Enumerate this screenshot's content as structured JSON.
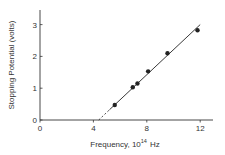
{
  "chart_data": {
    "type": "scatter",
    "title": "",
    "xlabel": "Frequency, 10^14 Hz",
    "xlabel_parts": {
      "main": "Frequency, 10",
      "sup": "14",
      "unit": "Hz"
    },
    "ylabel": "Stopping Potential (volts)",
    "xlim": [
      0,
      13
    ],
    "ylim": [
      0,
      3.5
    ],
    "xticks": [
      0,
      4,
      8,
      12
    ],
    "yticks": [
      0,
      1,
      2,
      3
    ],
    "grid": false,
    "legend": null,
    "series": [
      {
        "name": "measured",
        "marker": "filled-circle",
        "x": [
          5.6,
          6.95,
          7.3,
          8.1,
          9.55,
          11.8
        ],
        "y": [
          0.47,
          1.03,
          1.15,
          1.53,
          2.1,
          2.82
        ]
      }
    ],
    "fit_line": {
      "solid_from": [
        5.2,
        0.32
      ],
      "solid_to": [
        12.0,
        3.0
      ],
      "dashed_from": [
        4.4,
        0.0
      ],
      "dashed_to": [
        5.2,
        0.32
      ],
      "x_intercept": 4.4
    }
  },
  "colors": {
    "ink": "#222222",
    "background": "#ffffff"
  }
}
